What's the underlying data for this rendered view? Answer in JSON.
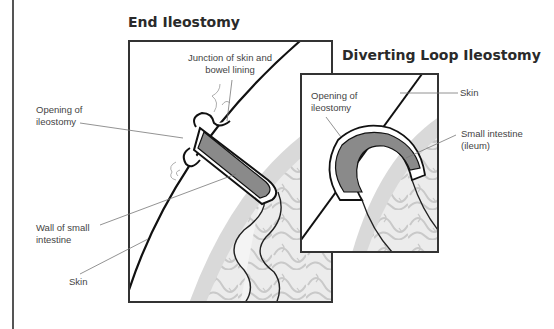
{
  "diagrams": [
    {
      "title": "End Ileostomy",
      "labels": {
        "junction_line1": "Junction of skin and",
        "junction_line2": "bowel lining",
        "opening_line1": "Opening of",
        "opening_line2": "ileostomy",
        "wall_line1": "Wall of small",
        "wall_line2": "intestine",
        "skin": "Skin"
      }
    },
    {
      "title": "Diverting Loop Ileostomy",
      "labels": {
        "opening_line1": "Opening of",
        "opening_line2": "ileostomy",
        "skin": "Skin",
        "intestine_line1": "Small intestine",
        "intestine_line2": "(ileum)"
      }
    }
  ],
  "colors": {
    "frame": "#333333",
    "bowel_lining": "#8a8a8a",
    "intestine_bg": "#e6e6e6",
    "intestine_line": "#cfcfcf",
    "leader": "#777777"
  }
}
